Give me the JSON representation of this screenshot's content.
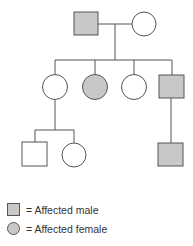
{
  "diagram": {
    "type": "pedigree",
    "colors": {
      "affected_fill": "#c8c8c8",
      "unaffected_fill": "#ffffff",
      "stroke": "#555555"
    },
    "generations": [
      {
        "id": "I",
        "individuals": [
          {
            "id": "I-1",
            "sex": "male",
            "affected": true
          },
          {
            "id": "I-2",
            "sex": "female",
            "affected": false
          }
        ]
      },
      {
        "id": "II",
        "individuals": [
          {
            "id": "II-1",
            "sex": "female",
            "affected": false
          },
          {
            "id": "II-2",
            "sex": "female",
            "affected": true
          },
          {
            "id": "II-3",
            "sex": "female",
            "affected": false
          },
          {
            "id": "II-4",
            "sex": "male",
            "affected": true
          }
        ]
      },
      {
        "id": "III",
        "individuals": [
          {
            "id": "III-1",
            "sex": "male",
            "affected": false,
            "parent": "II-1"
          },
          {
            "id": "III-2",
            "sex": "female",
            "affected": false,
            "parent": "II-1"
          },
          {
            "id": "III-3",
            "sex": "male",
            "affected": true,
            "parent": "II-4"
          }
        ]
      }
    ]
  },
  "legend": {
    "items": [
      {
        "symbol": "square",
        "label": "= Affected male"
      },
      {
        "symbol": "circle",
        "label": "= Affected female"
      }
    ]
  }
}
